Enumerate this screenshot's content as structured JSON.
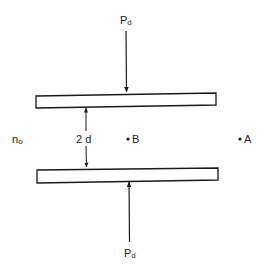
{
  "diagram": {
    "type": "parallel-plate geometry",
    "top_force": {
      "label": "P",
      "subscript": "d"
    },
    "bottom_force": {
      "label": "P",
      "subscript": "d"
    },
    "gap_label": "2 d",
    "medium_label": {
      "label": "n",
      "subscript": "o"
    },
    "points": [
      {
        "label": "B"
      },
      {
        "label": "A"
      }
    ],
    "colors": {
      "stroke": "#1a1a1a",
      "plate_fill": "#ffffff",
      "background": "#ffffff"
    }
  }
}
